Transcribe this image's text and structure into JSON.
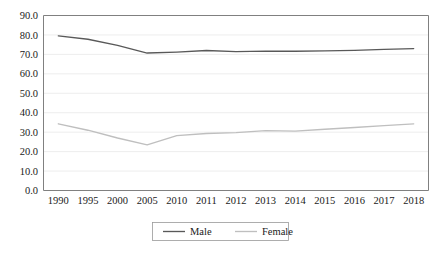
{
  "chart_data": {
    "type": "line",
    "title": "",
    "subtitle": "",
    "xlabel": "",
    "ylabel": "",
    "categories": [
      "1990",
      "1995",
      "2000",
      "2005",
      "2010",
      "2011",
      "2012",
      "2013",
      "2014",
      "2015",
      "2016",
      "2017",
      "2018"
    ],
    "series": [
      {
        "name": "Male",
        "color": "#595959",
        "values": [
          79.5,
          77.8,
          74.6,
          70.7,
          71.2,
          72.0,
          71.4,
          71.7,
          71.6,
          71.8,
          72.1,
          72.6,
          73.0
        ]
      },
      {
        "name": "Female",
        "color": "#bfbfbf",
        "values": [
          34.3,
          31.0,
          27.0,
          23.5,
          28.2,
          29.3,
          29.8,
          30.8,
          30.5,
          31.5,
          32.4,
          33.4,
          34.3
        ]
      }
    ],
    "ylim": [
      0,
      90
    ],
    "yticks": [
      "0.0",
      "10.0",
      "20.0",
      "30.0",
      "40.0",
      "50.0",
      "60.0",
      "70.0",
      "80.0",
      "90.0"
    ],
    "ytick_step": 10,
    "grid": true,
    "grid_axis": "y",
    "legend_position": "bottom",
    "legend_entries": [
      "Male",
      "Female"
    ]
  },
  "colors": {
    "male_line": "#595959",
    "female_line": "#bfbfbf",
    "grid": "#e8e8e8",
    "axis": "#808080",
    "text": "#1a1a1a",
    "background": "#ffffff"
  }
}
